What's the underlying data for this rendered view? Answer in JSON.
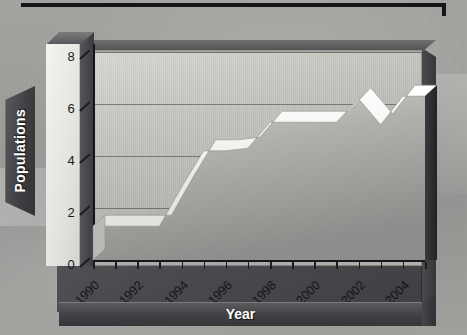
{
  "chart_data": {
    "type": "area",
    "title": "",
    "xlabel": "Year",
    "ylabel": "Populations",
    "xlim": [
      1990,
      2005
    ],
    "ylim": [
      0,
      8
    ],
    "ytick_values": [
      0,
      2,
      4,
      6,
      8
    ],
    "ytick_labels": [
      "0",
      "2",
      "4",
      "6",
      "8"
    ],
    "xtick_values": [
      1990,
      1991,
      1992,
      1993,
      1994,
      1995,
      1996,
      1997,
      1998,
      1999,
      2000,
      2001,
      2002,
      2003,
      2004,
      2005
    ],
    "xtick_labels_shown": [
      "1990",
      "1992",
      "1994",
      "1996",
      "1998",
      "2000",
      "2002",
      "2004"
    ],
    "xtick_label_rotation": -45,
    "grid": true,
    "grid_axis": "y",
    "legend": false,
    "style": "3d-ribbon-grayscale",
    "x": [
      1990,
      1991,
      1992,
      1993,
      1994,
      1995,
      1996,
      1997,
      1998,
      1999,
      2000,
      2001,
      2002,
      2003,
      2004,
      2005
    ],
    "values": [
      1.3,
      1.3,
      1.3,
      1.3,
      2.8,
      4.2,
      4.2,
      4.3,
      5.3,
      5.3,
      5.3,
      5.3,
      6.2,
      5.2,
      6.3,
      6.3
    ],
    "series": [
      {
        "name": "Populations",
        "values": [
          1.3,
          1.3,
          1.3,
          1.3,
          2.8,
          4.2,
          4.2,
          4.3,
          5.3,
          5.3,
          5.3,
          5.3,
          6.2,
          5.2,
          6.3,
          6.3
        ]
      }
    ]
  },
  "axis": {
    "y_label": "Populations",
    "x_label": "Year",
    "y_ticks": [
      "0",
      "2",
      "4",
      "6",
      "8"
    ],
    "x_ticks": [
      "1990",
      "1992",
      "1994",
      "1996",
      "1998",
      "2000",
      "2002",
      "2004"
    ]
  },
  "colors": {
    "frame": "#4a4a4e",
    "panel_light": "#d9d9d5",
    "panel_dark": "#a9a9a6",
    "ribbon_top": "#ffffff",
    "ribbon_side": "#2e2e31",
    "axis": "#17171a",
    "label_text": "#ffffff",
    "tick_text": "#141417",
    "background": "#9a9a97"
  }
}
